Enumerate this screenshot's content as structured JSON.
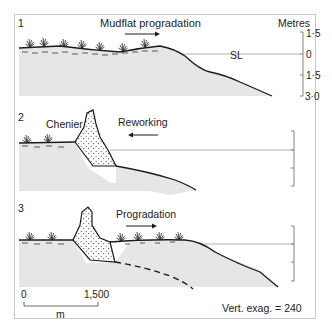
{
  "panels": [
    {
      "number": "1",
      "label": "Mudflat progradation",
      "arrow": "right",
      "sea_level_label": "SL"
    },
    {
      "number": "2",
      "label_left": "Chenier",
      "label_right": "Reworking",
      "arrow": "left"
    },
    {
      "number": "3",
      "label": "Progradation",
      "arrow": "right"
    }
  ],
  "axis": {
    "title": "Metres",
    "ticks": [
      "1·5",
      "0",
      "1·5",
      "3·0"
    ]
  },
  "scale_bar": {
    "start": "0",
    "end": "1,500",
    "unit": "m"
  },
  "vertical_exaggeration": "Vert. exag. = 240",
  "colors": {
    "sediment_fill": "#e6e6e6",
    "line": "#1a1a1a",
    "frame": "#c8c8c8",
    "sea_level": "#9a9a9a"
  }
}
